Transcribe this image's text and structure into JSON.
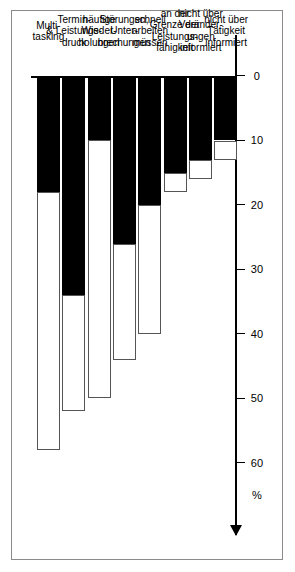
{
  "chart_data": {
    "type": "bar",
    "orientation": "horizontal",
    "stacked": true,
    "title": "",
    "xlabel": "",
    "ylabel": "%",
    "axis_unit": "%",
    "xlim": [
      0,
      65
    ],
    "ticks": [
      0,
      10,
      20,
      30,
      40,
      50,
      60
    ],
    "tick_labels": [
      "0",
      "10",
      "20",
      "30",
      "40",
      "50",
      "60"
    ],
    "grid": false,
    "axis_arrow": true,
    "legend": [],
    "categories": [
      "Multi-\ntasking",
      "Termin-\n& Leistungs-\ndruck",
      "häufige\nWieder-\nholungen",
      "Störungen,\nUnter-\nbrechungen",
      "schnell\narbeiten\nmüssen",
      "an der\nGrenze der\nLeistungs-\nfähigkeit",
      "nicht über\nVeränder-\nungen\ninformiert",
      "nicht über\nTätigkeit\ninformiert"
    ],
    "series": [
      {
        "name": "dunkel",
        "color": "#000000",
        "values": [
          18,
          34,
          10,
          26,
          20,
          15,
          13,
          10
        ]
      },
      {
        "name": "hell",
        "color": "#ffffff",
        "values": [
          40,
          18,
          40,
          18,
          20,
          3,
          3,
          3
        ]
      }
    ],
    "totals": [
      58,
      52,
      50,
      44,
      40,
      18,
      16,
      13
    ]
  }
}
